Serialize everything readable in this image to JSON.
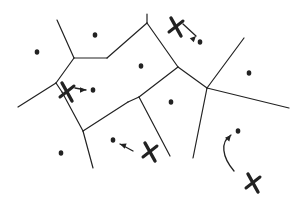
{
  "diagram": {
    "type": "voronoi-sketch",
    "stroke_color": "#222222",
    "background": "#ffffff",
    "edges": [
      [
        57,
        20,
        74,
        58
      ],
      [
        74,
        58,
        107,
        58
      ],
      [
        107,
        58,
        147,
        23
      ],
      [
        147,
        14,
        147,
        23
      ],
      [
        147,
        23,
        178,
        67
      ],
      [
        178,
        67,
        207,
        88
      ],
      [
        74,
        58,
        56,
        83
      ],
      [
        56,
        83,
        18,
        107
      ],
      [
        56,
        83,
        62,
        92
      ],
      [
        62,
        92,
        83,
        131
      ],
      [
        83,
        131,
        93,
        168
      ],
      [
        83,
        131,
        128,
        102
      ],
      [
        128,
        102,
        139,
        97
      ],
      [
        139,
        97,
        178,
        67
      ],
      [
        139,
        97,
        170,
        156
      ],
      [
        207,
        88,
        244,
        38
      ],
      [
        207,
        88,
        289,
        108
      ],
      [
        207,
        88,
        193,
        158
      ]
    ],
    "sites": [
      [
        37,
        52
      ],
      [
        95,
        35
      ],
      [
        141,
        66
      ],
      [
        200,
        42
      ],
      [
        249,
        73
      ],
      [
        93,
        90
      ],
      [
        171,
        102
      ],
      [
        61,
        153
      ],
      [
        113,
        140
      ],
      [
        238,
        131
      ]
    ],
    "crosses": [
      {
        "x": 176,
        "y": 27
      },
      {
        "x": 67,
        "y": 92
      },
      {
        "x": 150,
        "y": 152
      },
      {
        "x": 253,
        "y": 183
      }
    ],
    "arrows": [
      {
        "path": "M183,24 L196,36",
        "head": [
          196,
          36,
          -45
        ]
      },
      {
        "path": "M75,88 L86,90",
        "head": [
          86,
          90,
          0
        ]
      },
      {
        "path": "M133,151 L120,144",
        "head": [
          120,
          144,
          200
        ]
      },
      {
        "path": "M234,171 C222,157 220,142 231,135",
        "head": [
          231,
          135,
          -50
        ]
      }
    ]
  }
}
